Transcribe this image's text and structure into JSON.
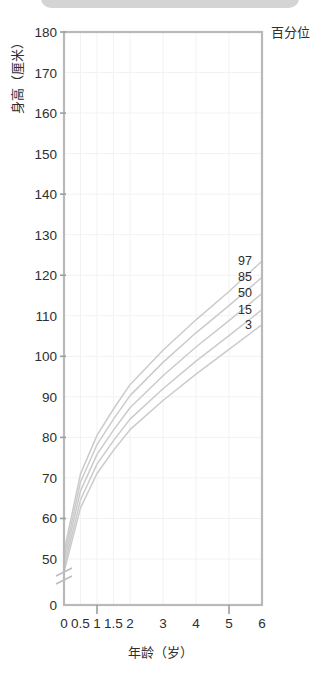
{
  "page": {
    "background": "#ffffff",
    "top_bar_color": "#d4d4d4"
  },
  "legend": {
    "title": "百分位",
    "position": "top-right"
  },
  "axes": {
    "y_title": "身高（厘米）",
    "x_title": "年龄（岁）",
    "y_ticks": [
      "0",
      "50",
      "60",
      "70",
      "80",
      "90",
      "100",
      "110",
      "120",
      "130",
      "140",
      "150",
      "160",
      "170",
      "180"
    ],
    "x_ticks": [
      "0",
      "0.5",
      "1",
      "1.5",
      "2",
      "3",
      "4",
      "5",
      "6"
    ],
    "y_break_between": [
      "0",
      "50"
    ]
  },
  "colors": {
    "curve": "#cbcbcb",
    "frame": "#b9b9b9",
    "grid": "#f2f2f2",
    "text": "#2e2e2e"
  },
  "chart_data": {
    "type": "line",
    "title": "",
    "subtitle": "",
    "xlabel": "年龄（岁）",
    "ylabel": "身高（厘米）",
    "legend_title": "百分位",
    "legend_position": "right",
    "grid": true,
    "xlim": [
      0,
      6
    ],
    "ylim": [
      50,
      180
    ],
    "y_axis_break": true,
    "y_axis_zero_shown": true,
    "x": [
      0,
      0.5,
      1,
      1.5,
      2,
      3,
      4,
      5,
      6
    ],
    "x_tick_labels": [
      "0",
      "0.5",
      "1",
      "1.5",
      "2",
      "3",
      "4",
      "5",
      "6"
    ],
    "y_tick_labels": [
      "0",
      "50",
      "60",
      "70",
      "80",
      "90",
      "100",
      "110",
      "120",
      "130",
      "140",
      "150",
      "160",
      "170",
      "180"
    ],
    "series": [
      {
        "name": "97",
        "label": "97",
        "values": [
          51.8,
          71.0,
          80.5,
          87.0,
          93.0,
          101.5,
          109.0,
          116.0,
          123.5
        ]
      },
      {
        "name": "85",
        "label": "85",
        "values": [
          50.4,
          69.0,
          78.2,
          84.5,
          90.3,
          98.5,
          105.8,
          112.5,
          119.5
        ]
      },
      {
        "name": "50",
        "label": "50",
        "values": [
          49.2,
          66.8,
          75.8,
          81.8,
          87.3,
          95.2,
          102.3,
          108.8,
          115.5
        ]
      },
      {
        "name": "15",
        "label": "15",
        "values": [
          47.9,
          64.6,
          73.4,
          79.2,
          84.5,
          92.0,
          98.8,
          105.1,
          111.5
        ]
      },
      {
        "name": "3",
        "label": "3",
        "values": [
          46.8,
          62.6,
          71.1,
          76.8,
          81.9,
          89.1,
          95.6,
          101.7,
          107.8
        ]
      }
    ]
  }
}
